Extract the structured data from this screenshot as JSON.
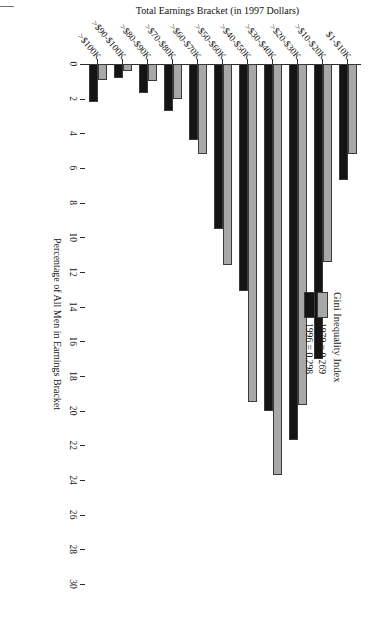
{
  "chart_data": {
    "type": "bar",
    "title": "",
    "orientation": "vertical-rotated-page",
    "xlabel": "Total Earnings Bracket (in 1997 Dollars)",
    "ylabel": "Percentage of All Men in Earnings Bracket",
    "ylim": [
      0,
      30
    ],
    "yticks": [
      0,
      2,
      4,
      6,
      8,
      10,
      12,
      14,
      16,
      18,
      20,
      22,
      24,
      26,
      28,
      30
    ],
    "grid": false,
    "legend_position": "upper-right",
    "categories": [
      "$1-$10K",
      ">$10-$20K",
      ">$20-$30K",
      ">$30-$40K",
      ">$40-$50K",
      ">$50-$60K",
      ">$60-$70K",
      ">$70-$80K",
      ">$80-$90K",
      ">$90-$100K",
      ">$100K"
    ],
    "series": [
      {
        "name": "1979",
        "color": "#a8a8a8",
        "values": [
          5.2,
          11.4,
          19.7,
          23.7,
          19.5,
          11.6,
          5.2,
          2.0,
          1.0,
          0.4,
          0.9
        ]
      },
      {
        "name": "1996",
        "color": "#141414",
        "values": [
          6.7,
          17.0,
          21.7,
          20.0,
          13.1,
          9.5,
          4.4,
          2.7,
          1.7,
          0.8,
          2.2
        ]
      }
    ]
  },
  "legend": {
    "title": "Gini Inequality Index",
    "entries": [
      {
        "label": "1979 = 0.269",
        "color": "#a8a8a8"
      },
      {
        "label": "1996 = 0.298",
        "color": "#141414"
      }
    ]
  },
  "axes": {
    "value_axis_title": "Percentage of All Men in Earnings Bracket",
    "category_axis_title": "Total Earnings Bracket (in 1997 Dollars)"
  }
}
